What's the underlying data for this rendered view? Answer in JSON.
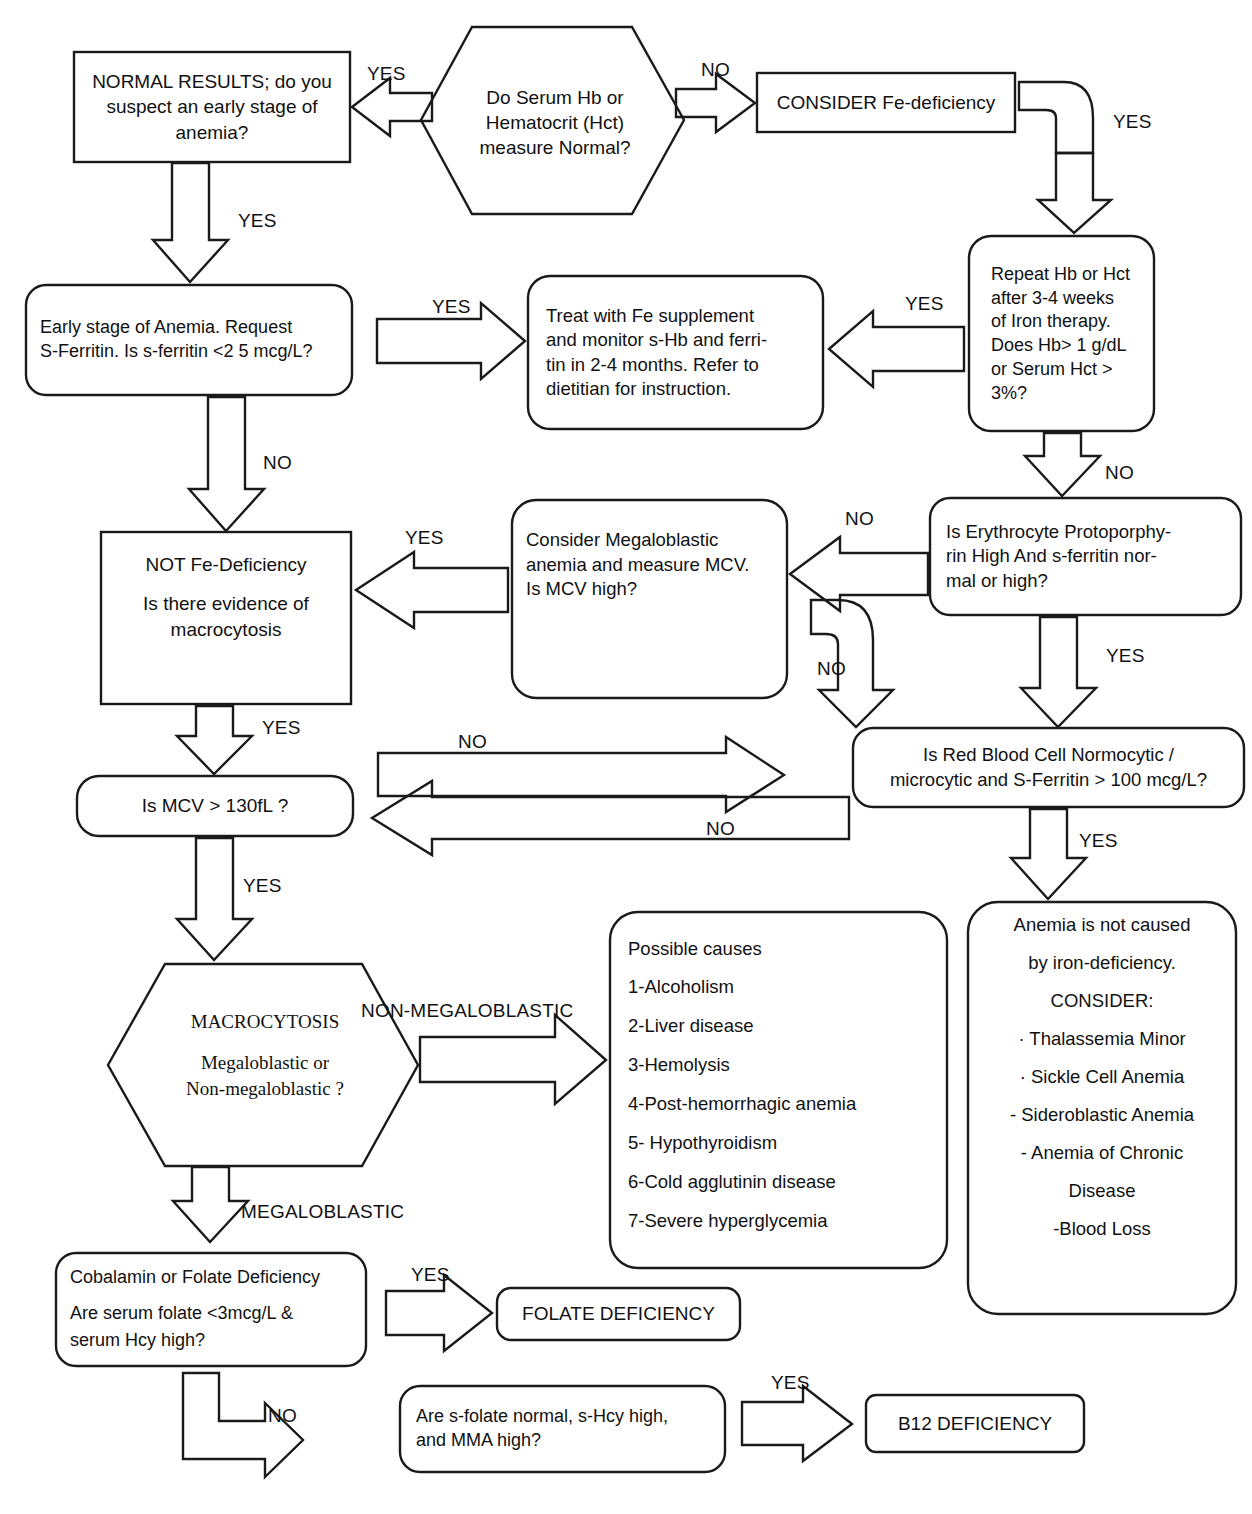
{
  "diagram": {
    "line_color": "#1a1a1a",
    "text_color": "#111111",
    "background": "#ffffff"
  },
  "nodes": {
    "normal_results": {
      "shape": "rect",
      "lines": [
        "NORMAL RESULTS; do you",
        "suspect an early stage of",
        "anemia?"
      ]
    },
    "serum_hb": {
      "shape": "hexagon",
      "lines": [
        "Do Serum Hb or",
        "Hematocrit (Hct)",
        "measure Normal?"
      ]
    },
    "consider_fe": {
      "shape": "rect",
      "lines": [
        "CONSIDER Fe-deficiency"
      ]
    },
    "repeat_hb": {
      "shape": "rounded",
      "lines": [
        "Repeat Hb or Hct",
        "after 3-4 weeks",
        "of Iron therapy.",
        "Does Hb> 1 g/dL",
        "or Serum Hct >",
        "3%?"
      ]
    },
    "early_stage": {
      "shape": "rounded",
      "lines": [
        "Early stage of Anemia. Request",
        "S-Ferritin. Is s-ferritin <2 5 mcg/L?"
      ]
    },
    "treat_fe": {
      "shape": "rounded",
      "lines": [
        "Treat with Fe supplement",
        "and monitor s-Hb and ferri-",
        "tin  in 2-4 months. Refer to",
        "dietitian for instruction."
      ]
    },
    "not_fe_deficiency": {
      "shape": "rect",
      "lines": [
        "NOT Fe-Deficiency",
        "",
        "Is there evidence of",
        "macrocytosis"
      ]
    },
    "consider_megaloblastic": {
      "shape": "rounded",
      "lines": [
        "Consider Megaloblastic",
        "anemia and measure MCV.",
        "Is MCV high?"
      ]
    },
    "erythrocyte_proto": {
      "shape": "rounded",
      "lines": [
        "Is Erythrocyte Protoporphy-",
        "rin High And s-ferritin  nor-",
        "mal or high?"
      ]
    },
    "mcv_130": {
      "shape": "rounded",
      "lines": [
        "Is MCV > 130fL ?"
      ]
    },
    "rbc_normocytic": {
      "shape": "rounded",
      "lines": [
        "Is Red Blood Cell Normocytic /",
        "microcytic and S-Ferritin > 100 mcg/L?"
      ]
    },
    "macrocytosis": {
      "shape": "hexagon",
      "lines": [
        "MACROCYTOSIS",
        "",
        "Megaloblastic or",
        "Non-megaloblastic ?"
      ]
    },
    "possible_causes": {
      "shape": "rounded",
      "lines": [
        "Possible causes",
        "1-Alcoholism",
        "2-Liver disease",
        "3-Hemolysis",
        "4-Post-hemorrhagic anemia",
        "5- Hypothyroidism",
        "6-Cold agglutinin disease",
        "7-Severe hyperglycemia"
      ]
    },
    "not_iron_deficiency": {
      "shape": "rounded",
      "lines": [
        "Anemia is not caused",
        "by iron-deficiency.",
        "CONSIDER:",
        "· Thalassemia Minor",
        "· Sickle Cell Anemia",
        "- Sideroblastic Anemia",
        "- Anemia of Chronic",
        "Disease",
        "-Blood Loss"
      ]
    },
    "cobalamin_folate": {
      "shape": "rounded",
      "lines": [
        "Cobalamin or Folate Deficiency",
        "",
        "Are serum folate <3mcg/L &",
        "serum  Hcy high?"
      ]
    },
    "folate_deficiency": {
      "shape": "rounded",
      "lines": [
        "FOLATE DEFICIENCY"
      ]
    },
    "sfolate_normal": {
      "shape": "rounded",
      "lines": [
        "Are s-folate normal, s-Hcy high,",
        "and MMA high?"
      ]
    },
    "b12_deficiency": {
      "shape": "rect",
      "lines": [
        "B12 DEFICIENCY"
      ]
    }
  },
  "edge_labels": {
    "hex_to_normal": "YES",
    "hex_to_considerfe": "NO",
    "considerfe_to_repeat": "YES",
    "normal_to_early": "YES",
    "early_to_treat": "YES",
    "repeat_to_treat": "YES",
    "early_to_notfe": "NO",
    "repeat_to_erythro": "NO",
    "megalo_to_notfe": "YES",
    "erythro_to_megalo": "NO",
    "megalo_down_to_rbc": "NO",
    "erythro_to_rbc": "YES",
    "mcv_to_rbc": "NO",
    "rbc_to_mcv": "NO",
    "notfe_to_mcv": "YES",
    "mcv_to_macro": "YES",
    "rbc_to_notiron": "YES",
    "macro_nonmega": "NON-MEGALOBLASTIC",
    "macro_mega": "MEGALOBLASTIC",
    "cobalamin_to_folate": "YES",
    "cobalamin_to_sfolate": "NO",
    "sfolate_to_b12": "YES"
  }
}
